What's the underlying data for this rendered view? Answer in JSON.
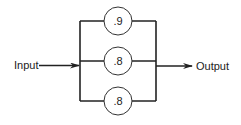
{
  "diagram": {
    "type": "parallel reliability block diagram",
    "input_label": "Input",
    "output_label": "Output",
    "components": [
      {
        "id": "top",
        "reliability": ".9"
      },
      {
        "id": "middle",
        "reliability": ".8"
      },
      {
        "id": "bottom",
        "reliability": ".8"
      }
    ],
    "colors": {
      "line": "#222222",
      "background": "#ffffff"
    }
  }
}
